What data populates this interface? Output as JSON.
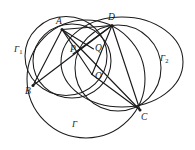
{
  "figure": {
    "kind": "geometry-diagram",
    "background_color": "#ffffff",
    "stroke_color": "#1a1a1a",
    "width": 195,
    "height": 150,
    "points": [
      {
        "id": "A",
        "label": "A",
        "x": 62.0,
        "y": 29.5,
        "label_x": 56.0,
        "label_y": 16.5
      },
      {
        "id": "D",
        "label": "D",
        "x": 112.0,
        "y": 25.5,
        "label_x": 108.0,
        "label_y": 12.5
      },
      {
        "id": "B",
        "label": "B",
        "x": 33.0,
        "y": 85.5,
        "label_x": 25.0,
        "label_y": 86.5
      },
      {
        "id": "C",
        "label": "C",
        "x": 140.0,
        "y": 110.0,
        "label_x": 141.0,
        "label_y": 112.5
      },
      {
        "id": "P",
        "label": "P",
        "x": 80.5,
        "y": 48.5,
        "label_x": 70.0,
        "label_y": 45.0
      },
      {
        "id": "Q",
        "label": "Q",
        "x": 92.5,
        "y": 48.0,
        "label_x": 95.0,
        "label_y": 43.5
      },
      {
        "id": "O",
        "label": "O",
        "x": 92.0,
        "y": 74.0,
        "label_x": 95.0,
        "label_y": 72.0
      }
    ],
    "circle_labels": [
      {
        "id": "Gamma1",
        "label": "Γ",
        "subscript": "1",
        "x": 14.0,
        "y": 45.0
      },
      {
        "id": "Gamma2",
        "label": "Γ",
        "subscript": "2",
        "x": 160.0,
        "y": 54.0
      },
      {
        "id": "Gamma",
        "label": "Γ",
        "subscript": "",
        "x": 72.0,
        "y": 120.0
      }
    ],
    "circles": [
      {
        "id": "Gamma1",
        "name": "circle-gamma-1",
        "cx": 66.0,
        "cy": 56.0,
        "r": 41.0
      },
      {
        "id": "Gamma2",
        "name": "circle-gamma-2",
        "cx": 122.0,
        "cy": 62.0,
        "r": 61.0
      },
      {
        "id": "Gamma",
        "name": "circle-gamma",
        "cx": 86.0,
        "cy": 79.0,
        "r": 59.0
      },
      {
        "id": "inner",
        "name": "circle-inner-abqo",
        "cx": 72.0,
        "cy": 60.0,
        "r": 39.0
      },
      {
        "id": "right",
        "name": "circle-right-dqoc",
        "cx": 119.0,
        "cy": 68.0,
        "r": 43.0
      }
    ],
    "chords": [
      {
        "id": "A-B",
        "from": "A",
        "to": "B"
      },
      {
        "id": "A-C",
        "from": "A",
        "to": "C"
      },
      {
        "id": "A-D",
        "from": "A",
        "to": "D"
      },
      {
        "id": "A-Q",
        "from": "A",
        "to": "Q"
      },
      {
        "id": "A-O",
        "from": "A",
        "to": "O"
      },
      {
        "id": "B-D",
        "from": "B",
        "to": "D"
      },
      {
        "id": "B-P",
        "from": "B",
        "to": "P"
      },
      {
        "id": "D-O",
        "from": "D",
        "to": "O"
      },
      {
        "id": "D-C",
        "from": "D",
        "to": "C"
      },
      {
        "id": "D-P",
        "from": "D",
        "to": "P"
      },
      {
        "id": "O-C",
        "from": "O",
        "to": "C"
      }
    ]
  }
}
